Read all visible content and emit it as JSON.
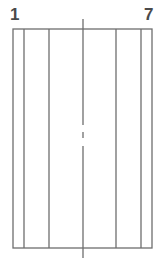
{
  "labels": {
    "left": "1",
    "right": "7"
  },
  "diagram": {
    "stroke_color": "#6e6e6e",
    "rect": {
      "x1": 13,
      "y1": 29,
      "x2": 152,
      "y2": 248
    },
    "vertical_lines_x": [
      24,
      49,
      116,
      141
    ],
    "center_line": {
      "x": 83,
      "top": 19,
      "bottom": 258
    }
  }
}
